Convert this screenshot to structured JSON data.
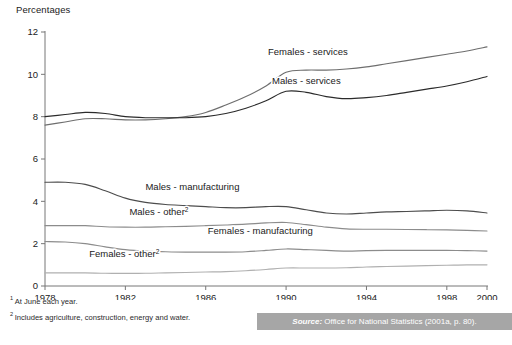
{
  "figure": {
    "axis_title": "Percentages",
    "footnote_1_marker": "1",
    "footnote_1": "At June each year.",
    "footnote_2_marker": "2",
    "footnote_2": "Includes agriculture, construction, energy and water.",
    "source_keyword": "Source:",
    "source_text": "Office for National Statistics (2001a, p. 80).",
    "source_bar_color": "#a6a6a6"
  },
  "chart_data": {
    "type": "line",
    "title": "",
    "subtitle": "",
    "xlabel": "",
    "ylabel": "Percentages",
    "xlim": [
      1978,
      2000
    ],
    "ylim": [
      0,
      12
    ],
    "grid": false,
    "legend": "inline-labels",
    "xticks": [
      1978,
      1982,
      1986,
      1990,
      1994,
      1998,
      2000
    ],
    "xtick_labels": [
      "1978",
      "1982",
      "1986",
      "1990",
      "1994",
      "1998",
      "2000"
    ],
    "yticks": [
      0,
      2,
      4,
      6,
      8,
      10,
      12
    ],
    "ytick_labels": [
      "0",
      "2",
      "4",
      "6",
      "8",
      "10",
      "12"
    ],
    "x": [
      1978,
      1979,
      1980,
      1981,
      1982,
      1983,
      1984,
      1985,
      1986,
      1987,
      1988,
      1989,
      1990,
      1991,
      1992,
      1993,
      1994,
      1995,
      1996,
      1997,
      1998,
      1999,
      2000
    ],
    "series": [
      {
        "name": "Females - services",
        "label": "Females - services",
        "color": "#6e6e6e",
        "label_x": 1989.1,
        "label_y": 10.9,
        "values": [
          7.6,
          7.75,
          7.9,
          7.9,
          7.85,
          7.85,
          7.9,
          8.0,
          8.2,
          8.55,
          8.95,
          9.45,
          10.1,
          10.2,
          10.2,
          10.25,
          10.35,
          10.5,
          10.65,
          10.8,
          10.95,
          11.1,
          11.3
        ]
      },
      {
        "name": "Males - services",
        "label": "Males - services",
        "color": "#2b2b2b",
        "label_x": 1989.3,
        "label_y": 9.55,
        "values": [
          8.0,
          8.1,
          8.2,
          8.15,
          8.0,
          7.95,
          7.95,
          7.95,
          8.0,
          8.15,
          8.4,
          8.75,
          9.2,
          9.15,
          8.95,
          8.85,
          8.9,
          9.0,
          9.15,
          9.3,
          9.45,
          9.65,
          9.9
        ]
      },
      {
        "name": "Males - manufacturing",
        "label": "Males - manufacturing",
        "color": "#4d4d4d",
        "label_x": 1983.0,
        "label_y": 4.55,
        "values": [
          4.9,
          4.9,
          4.8,
          4.5,
          4.15,
          3.95,
          3.85,
          3.8,
          3.75,
          3.7,
          3.7,
          3.75,
          3.75,
          3.6,
          3.45,
          3.4,
          3.45,
          3.5,
          3.52,
          3.55,
          3.58,
          3.55,
          3.45
        ]
      },
      {
        "name": "Males - other",
        "label": "Males - other",
        "label_superscript": "2",
        "color": "#8c8c8c",
        "label_x": 1982.2,
        "label_y": 3.35,
        "values": [
          2.85,
          2.85,
          2.85,
          2.8,
          2.78,
          2.78,
          2.8,
          2.82,
          2.85,
          2.88,
          2.92,
          2.98,
          3.0,
          2.9,
          2.78,
          2.7,
          2.68,
          2.68,
          2.67,
          2.66,
          2.65,
          2.63,
          2.6
        ]
      },
      {
        "name": "Females - manufacturing",
        "label": "Females - manufacturing",
        "color": "#8c8c8c",
        "label_x": 1986.1,
        "label_y": 2.45,
        "values": [
          2.1,
          2.08,
          2.0,
          1.85,
          1.72,
          1.65,
          1.62,
          1.6,
          1.6,
          1.6,
          1.62,
          1.68,
          1.75,
          1.72,
          1.68,
          1.65,
          1.67,
          1.68,
          1.68,
          1.68,
          1.68,
          1.67,
          1.65
        ]
      },
      {
        "name": "Females - other",
        "label": "Females - other",
        "label_superscript": "2",
        "color": "#b0b0b0",
        "label_x": 1980.2,
        "label_y": 1.35,
        "values": [
          0.62,
          0.62,
          0.62,
          0.6,
          0.6,
          0.6,
          0.62,
          0.64,
          0.66,
          0.68,
          0.72,
          0.78,
          0.85,
          0.85,
          0.85,
          0.86,
          0.9,
          0.92,
          0.94,
          0.96,
          0.98,
          1.0,
          1.0
        ]
      }
    ]
  }
}
